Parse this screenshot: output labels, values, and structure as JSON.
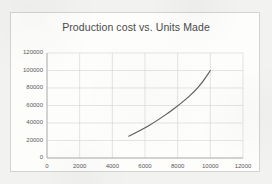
{
  "chart": {
    "title": "Production cost vs. Units Made",
    "axis_color": "#a6a6a6",
    "grid_color": "#d9d9d9",
    "series_color": "#595959",
    "plot_background": "#ffffff"
  },
  "chart_data": {
    "type": "line",
    "title": "Production cost vs. Units Made",
    "xlabel": "",
    "ylabel": "",
    "xlim": [
      0,
      12000
    ],
    "ylim": [
      0,
      120000
    ],
    "xticks": [
      0,
      2000,
      4000,
      6000,
      8000,
      10000,
      12000
    ],
    "yticks": [
      0,
      20000,
      40000,
      60000,
      80000,
      100000,
      120000
    ],
    "xtick_labels": [
      "0",
      "2000",
      "4000",
      "6000",
      "8000",
      "10000",
      "12000"
    ],
    "ytick_labels": [
      "0",
      "20000",
      "40000",
      "60000",
      "80000",
      "100000",
      "120000"
    ],
    "grid": true,
    "legend": false,
    "legend_position": "none",
    "series": [
      {
        "name": "Production cost",
        "x": [
          5000,
          5500,
          6000,
          6500,
          7000,
          7500,
          8000,
          8500,
          9000,
          9500,
          10000
        ],
        "values": [
          25000,
          29500,
          34500,
          40000,
          46000,
          52500,
          59500,
          67000,
          75500,
          86000,
          100000
        ]
      }
    ]
  }
}
